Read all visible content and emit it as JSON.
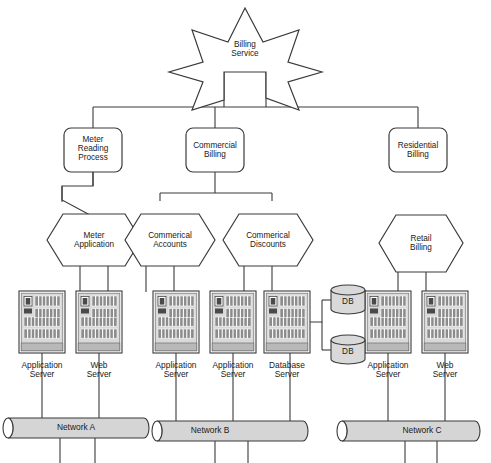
{
  "diagram": {
    "root": {
      "label": "Billing\nService",
      "shape": "star"
    },
    "processes": [
      {
        "id": "meter-reading-process",
        "label": "Meter\nReading\nProcess",
        "shape": "rounded-rect"
      },
      {
        "id": "commercial-billing",
        "label": "Commercial\nBilling",
        "shape": "rounded-rect"
      },
      {
        "id": "residential-billing",
        "label": "Residential\nBilling",
        "shape": "rounded-rect"
      }
    ],
    "applications": [
      {
        "id": "meter-application",
        "label": "Meter\nApplication",
        "shape": "hexagon"
      },
      {
        "id": "commerical-accounts",
        "label": "Commerical\nAccounts",
        "shape": "hexagon"
      },
      {
        "id": "commerical-discounts",
        "label": "Commerical\nDiscounts",
        "shape": "hexagon"
      },
      {
        "id": "retail-billing",
        "label": "Retail\nBilling",
        "shape": "hexagon"
      }
    ],
    "servers": [
      {
        "id": "server-1",
        "label": "Application\nServer",
        "network": "Network A"
      },
      {
        "id": "server-2",
        "label": "Web\nServer",
        "network": "Network A"
      },
      {
        "id": "server-3",
        "label": "Application\nServer",
        "network": "Network B"
      },
      {
        "id": "server-4",
        "label": "Application\nServer",
        "network": "Network B"
      },
      {
        "id": "server-5",
        "label": "Database\nServer",
        "network": "Network B"
      },
      {
        "id": "server-6",
        "label": "Application\nServer",
        "network": "Network C"
      },
      {
        "id": "server-7",
        "label": "Web\nServer",
        "network": "Network C"
      }
    ],
    "databases": [
      {
        "id": "db-top",
        "label": "DB"
      },
      {
        "id": "db-bottom",
        "label": "DB"
      }
    ],
    "networks": [
      {
        "id": "network-a",
        "label": "Network A"
      },
      {
        "id": "network-b",
        "label": "Network B"
      },
      {
        "id": "network-c",
        "label": "Network C"
      }
    ],
    "colors": {
      "stroke": "#3a3a3a",
      "text": "#1a1a1a",
      "shape_fill": "#ffffff",
      "server_body": "#d9d9d9",
      "server_dark": "#4a4a4a",
      "server_slot": "#8c8c8c",
      "network_fill": "#d5d5d5",
      "db_fill": "#d9d9d9",
      "background": "#ffffff"
    }
  }
}
